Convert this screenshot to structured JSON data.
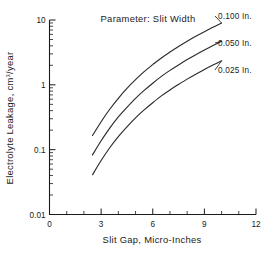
{
  "chart_data": {
    "type": "line",
    "title": "Parameter: Slit Width",
    "xlabel": "Slit Gap, Micro-Inches",
    "ylabel": "Electrolyte Leakage, cm3/year",
    "ylabel_main": "Electrolyte Leakage,  cm",
    "ylabel_sup": "3",
    "ylabel_tail": "/year",
    "xlim": [
      0,
      12
    ],
    "ylim": [
      0.01,
      10
    ],
    "yscale": "log",
    "xscale": "linear",
    "grid": false,
    "legend_position": "right-inline-labels",
    "xticks": [
      0,
      3,
      6,
      9,
      12
    ],
    "xtick_labels": [
      "0",
      "3",
      "6",
      "9",
      "12"
    ],
    "xminor_step": 1,
    "yticks": [
      10,
      1,
      0.1,
      0.01
    ],
    "ytick_labels": [
      "10",
      "1",
      "0.1",
      "0.01"
    ],
    "series": [
      {
        "name": "0.100 In.",
        "label": "0.100 In.",
        "x": [
          2.5,
          3.0,
          3.5,
          4.0,
          4.5,
          5.0,
          5.5,
          6.0,
          6.5,
          7.0,
          7.5,
          8.0,
          8.5,
          9.0,
          9.5,
          10.0
        ],
        "y": [
          0.165,
          0.27,
          0.42,
          0.62,
          0.88,
          1.2,
          1.6,
          2.05,
          2.6,
          3.2,
          3.9,
          4.7,
          5.6,
          6.6,
          7.7,
          9.0
        ]
      },
      {
        "name": "0.050 In.",
        "label": "0.050 In.",
        "x": [
          2.5,
          3.0,
          3.5,
          4.0,
          4.5,
          5.0,
          5.5,
          6.0,
          6.5,
          7.0,
          7.5,
          8.0,
          8.5,
          9.0,
          9.5,
          10.0
        ],
        "y": [
          0.083,
          0.137,
          0.215,
          0.32,
          0.45,
          0.62,
          0.82,
          1.06,
          1.35,
          1.67,
          2.03,
          2.45,
          2.92,
          3.45,
          4.05,
          4.7
        ]
      },
      {
        "name": "0.025 In.",
        "label": "0.025 In.",
        "x": [
          2.5,
          3.0,
          3.5,
          4.0,
          4.5,
          5.0,
          5.5,
          6.0,
          6.5,
          7.0,
          7.5,
          8.0,
          8.5,
          9.0,
          9.5,
          10.0
        ],
        "y": [
          0.041,
          0.068,
          0.107,
          0.159,
          0.225,
          0.31,
          0.41,
          0.53,
          0.675,
          0.835,
          1.015,
          1.225,
          1.46,
          1.72,
          2.02,
          2.35
        ]
      }
    ]
  },
  "colors": {
    "curve": "#2b2b2b",
    "axis": "#1a1a1a",
    "background": "#ffffff"
  }
}
